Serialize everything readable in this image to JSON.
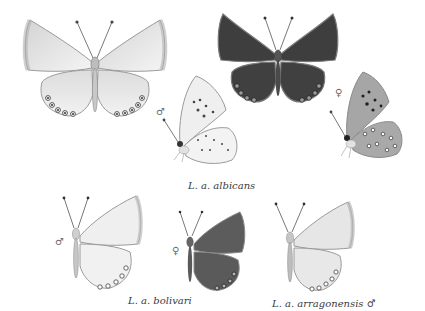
{
  "plate": {
    "background": "#ffffff",
    "specimens": [
      {
        "id": "albicans-male-upperside",
        "view": "upperside",
        "sex": "male",
        "tone": "pale",
        "wing_color": "#e6e6e6"
      },
      {
        "id": "albicans-female-upperside",
        "view": "upperside",
        "sex": "female",
        "tone": "dark",
        "wing_color": "#3c3c3c"
      },
      {
        "id": "albicans-male-underside",
        "view": "underside",
        "sex": "male",
        "sex_symbol": "♂",
        "wing_color": "#eeeeee"
      },
      {
        "id": "albicans-female-underside",
        "view": "underside",
        "sex": "female",
        "sex_symbol": "♀",
        "wing_color": "#a8a8a8"
      },
      {
        "id": "bolivari-male-upperside",
        "view": "upperside-half",
        "sex": "male",
        "sex_symbol": "♂",
        "wing_color": "#ececec"
      },
      {
        "id": "bolivari-female-upperside",
        "view": "upperside-half",
        "sex": "female",
        "sex_symbol": "♀",
        "wing_color": "#5a5a5a"
      },
      {
        "id": "arragonensis-male-upperside",
        "view": "upperside-half",
        "sex": "male",
        "wing_color": "#e2e2e2"
      }
    ],
    "captions": {
      "albicans": "L. a. albicans",
      "bolivari": "L. a. bolivari",
      "arragonensis": "L. a. arragonensis ♂"
    },
    "sex_symbols": {
      "male": "♂",
      "female": "♀"
    }
  }
}
